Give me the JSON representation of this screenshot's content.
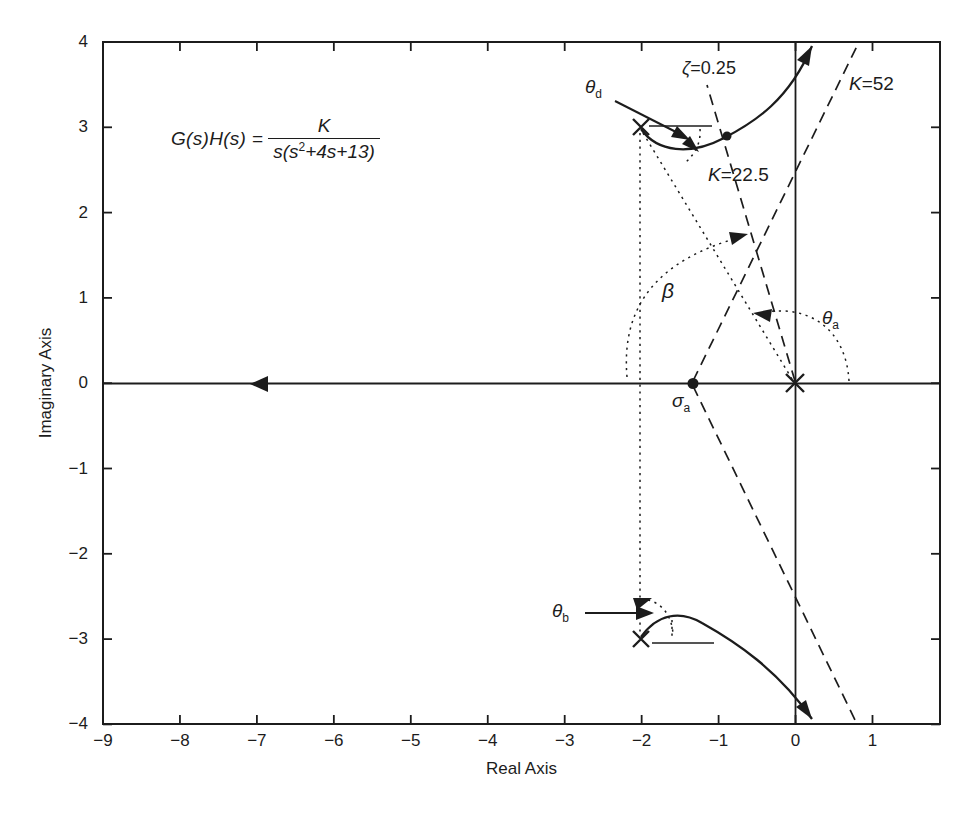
{
  "axes": {
    "xlabel": "Real Axis",
    "ylabel": "Imaginary Axis",
    "x_tick_labels": [
      "−9",
      "−8",
      "−7",
      "−6",
      "−5",
      "−4",
      "−3",
      "−2",
      "−1",
      "0",
      "1"
    ],
    "y_tick_labels": [
      "4",
      "3",
      "2",
      "1",
      "0",
      "−1",
      "−2",
      "−3",
      "−4"
    ]
  },
  "equation": {
    "lhs": "G(s)H(s) =",
    "numerator": "K",
    "den_pre": "s(s",
    "den_sup": "2",
    "den_post": "+4s+13)"
  },
  "annotations": {
    "zeta": {
      "var": "ζ",
      "rest": "=0.25"
    },
    "k_crossing": {
      "var": "K",
      "rest": "=52"
    },
    "k_on_zeta": {
      "var": "K",
      "rest": "=22.5"
    },
    "beta": {
      "main": "β"
    },
    "theta_a": {
      "main": "θ",
      "sub": "a"
    },
    "theta_d": {
      "main": "θ",
      "sub": "d"
    },
    "theta_b": {
      "main": "θ",
      "sub": "b"
    },
    "sigma_a": {
      "main": "σ",
      "sub": "a"
    }
  },
  "chart_data": {
    "type": "line",
    "title": "",
    "xlabel": "Real Axis",
    "ylabel": "Imaginary Axis",
    "xlim": [
      -9,
      1.9
    ],
    "ylim": [
      -4,
      4
    ],
    "x_ticks": [
      -9,
      -8,
      -7,
      -6,
      -5,
      -4,
      -3,
      -2,
      -1,
      0,
      1
    ],
    "y_ticks": [
      4,
      3,
      2,
      1,
      0,
      -1,
      -2,
      -3,
      -4
    ],
    "grid": false,
    "system": "G(s)H(s) = K / (s(s^2+4s+13))",
    "open_loop_poles": [
      [
        0,
        0
      ],
      [
        -2,
        3
      ],
      [
        -2,
        -3
      ]
    ],
    "asymptote_centroid": [
      -1.33,
      0
    ],
    "series": [
      {
        "name": "real-axis branch",
        "style": "solid",
        "points": [
          [
            0,
            0
          ],
          [
            -9,
            0
          ]
        ],
        "arrow_at": [
          -6.9,
          0
        ]
      },
      {
        "name": "upper complex branch",
        "style": "solid",
        "points": [
          [
            -2,
            3
          ],
          [
            -1.55,
            2.73
          ],
          [
            -0.87,
            2.88
          ],
          [
            -0.35,
            3.25
          ],
          [
            0,
            3.6
          ],
          [
            0.22,
            3.95
          ]
        ]
      },
      {
        "name": "lower complex branch",
        "style": "solid",
        "points": [
          [
            -2,
            -3
          ],
          [
            -1.5,
            -2.72
          ],
          [
            -0.87,
            -2.97
          ],
          [
            -0.35,
            -3.25
          ],
          [
            0,
            -3.6
          ],
          [
            0.22,
            -3.95
          ]
        ]
      },
      {
        "name": "zeta damping line",
        "style": "dashed",
        "points": [
          [
            0,
            0
          ],
          [
            -1.13,
            3.5
          ]
        ]
      },
      {
        "name": "asymptote +60deg",
        "style": "dashed",
        "points": [
          [
            -1.33,
            0
          ],
          [
            0.82,
            3.97
          ]
        ]
      },
      {
        "name": "asymptote -60deg",
        "style": "dashed",
        "points": [
          [
            -1.33,
            0
          ],
          [
            0.79,
            -3.97
          ]
        ]
      }
    ],
    "markers": [
      {
        "label": "K=22.5 point",
        "point": [
          -0.87,
          2.88
        ]
      },
      {
        "label": "sigma_a centroid",
        "point": [
          -1.33,
          0
        ]
      },
      {
        "label": "K=52 jw-axis crossing",
        "point": [
          0,
          3.6
        ]
      }
    ],
    "angle_annotations": [
      "theta_d departure (upper pole)",
      "theta_b departure (lower pole)",
      "theta_a asymptote angle",
      "beta damping angle"
    ]
  }
}
